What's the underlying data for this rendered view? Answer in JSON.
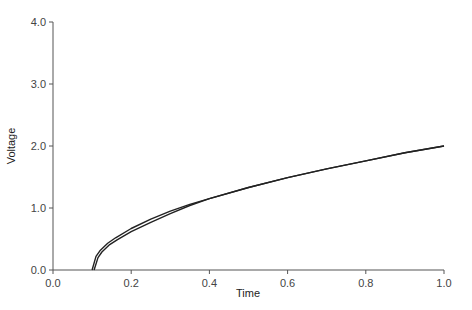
{
  "chart_data": {
    "type": "line",
    "title": "",
    "xlabel": "Time",
    "ylabel": "Voltage",
    "xlim": [
      0.0,
      1.0
    ],
    "ylim": [
      0.0,
      4.0
    ],
    "xticks": [
      "0.0",
      "0.2",
      "0.4",
      "0.6",
      "0.8",
      "1.0"
    ],
    "yticks": [
      "0.0",
      "1.0",
      "2.0",
      "3.0",
      "4.0"
    ],
    "grid": false,
    "legend": null,
    "series": [
      {
        "name": "curve-upper",
        "x": [
          0.1,
          0.11,
          0.12,
          0.14,
          0.16,
          0.2,
          0.25,
          0.3,
          0.35,
          0.4,
          0.5,
          0.6,
          0.7,
          0.8,
          0.9,
          1.0
        ],
        "y": [
          0.0,
          0.22,
          0.31,
          0.43,
          0.52,
          0.67,
          0.82,
          0.95,
          1.06,
          1.15,
          1.33,
          1.49,
          1.63,
          1.76,
          1.89,
          2.0
        ]
      },
      {
        "name": "curve-lower",
        "x": [
          0.105,
          0.115,
          0.125,
          0.145,
          0.165,
          0.2,
          0.25,
          0.3,
          0.35,
          0.4,
          0.5,
          0.6,
          0.7,
          0.8,
          0.9,
          1.0
        ],
        "y": [
          0.0,
          0.2,
          0.29,
          0.41,
          0.49,
          0.62,
          0.77,
          0.91,
          1.04,
          1.15,
          1.33,
          1.49,
          1.63,
          1.76,
          1.89,
          2.0
        ]
      }
    ],
    "line_color": "#222222",
    "axis_color": "#555555"
  }
}
